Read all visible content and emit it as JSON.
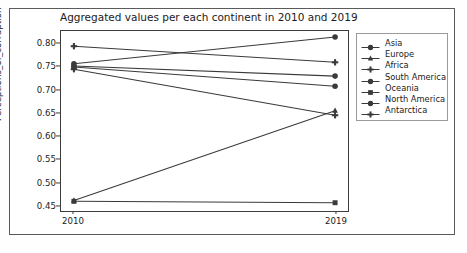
{
  "chart_data": {
    "type": "line",
    "title": "Aggregated values per each continent in 2010 and 2019",
    "xlabel": "",
    "ylabel": "Perceptions_of_corruption",
    "categories": [
      "2010",
      "2019"
    ],
    "x_tick_labels": [
      "2010",
      "2019"
    ],
    "y_tick_labels": [
      "0.45",
      "0.50",
      "0.55",
      "0.60",
      "0.65",
      "0.70",
      "0.75",
      "0.80"
    ],
    "y_ticks": [
      0.45,
      0.5,
      0.55,
      0.6,
      0.65,
      0.7,
      0.75,
      0.8
    ],
    "ylim": [
      0.437,
      0.828
    ],
    "xlim": [
      0,
      1
    ],
    "grid": false,
    "legend_position": "right-outside",
    "line_color": "#3a3a3a",
    "series": [
      {
        "name": "Asia",
        "marker": "circle",
        "values": [
          0.757,
          0.815
        ]
      },
      {
        "name": "Europe",
        "marker": "triangle",
        "values": [
          0.46,
          0.655
        ]
      },
      {
        "name": "Africa",
        "marker": "plus",
        "values": [
          0.745,
          0.645
        ]
      },
      {
        "name": "South America",
        "marker": "circle",
        "values": [
          0.752,
          0.73
        ]
      },
      {
        "name": "Oceania",
        "marker": "square",
        "values": [
          0.458,
          0.455
        ]
      },
      {
        "name": "North America",
        "marker": "circle",
        "values": [
          0.75,
          0.708
        ]
      },
      {
        "name": "Antarctica",
        "marker": "plus",
        "values": [
          0.795,
          0.76
        ]
      }
    ]
  },
  "legend": {
    "items": [
      {
        "label": "Asia"
      },
      {
        "label": "Europe"
      },
      {
        "label": "Africa"
      },
      {
        "label": "South America"
      },
      {
        "label": "Oceania"
      },
      {
        "label": "North America"
      },
      {
        "label": "Antarctica"
      }
    ]
  }
}
